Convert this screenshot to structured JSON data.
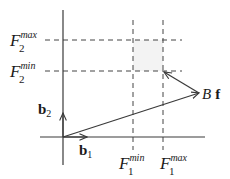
{
  "diagram": {
    "type": "vector-bounds-diagram",
    "axes": {
      "vertical": {
        "x": 63,
        "y1": 10,
        "y2": 165
      },
      "horizontal": {
        "y": 137,
        "x1": 40,
        "x2": 205
      }
    },
    "bounds_box": {
      "x_min": 133,
      "x_max": 163,
      "y_min": 40,
      "y_max": 71,
      "fill": "#f3f3f3"
    },
    "colors": {
      "line": "#3a3a3a",
      "dash": "#444444",
      "text": "#1a1a1a"
    }
  },
  "labels": {
    "f2_max": {
      "base": "F",
      "sub": "2",
      "sup": "max"
    },
    "f2_min": {
      "base": "F",
      "sub": "2",
      "sup": "min"
    },
    "f1_min": {
      "base": "F",
      "sub": "1",
      "sup": "min"
    },
    "f1_max": {
      "base": "F",
      "sub": "1",
      "sup": "max"
    },
    "b1": {
      "base": "b",
      "sub": "1"
    },
    "b2": {
      "base": "b",
      "sub": "2"
    },
    "bf": {
      "scalar": "B",
      "vector": "f"
    }
  },
  "vectors": [
    {
      "name": "b1",
      "from": [
        63,
        137
      ],
      "to": [
        87,
        137
      ]
    },
    {
      "name": "b2",
      "from": [
        63,
        137
      ],
      "to": [
        63,
        113
      ]
    },
    {
      "name": "Bf",
      "from": [
        63,
        137
      ],
      "to": [
        199,
        93
      ]
    },
    {
      "name": "projection",
      "from": [
        199,
        93
      ],
      "to": [
        163,
        71
      ]
    }
  ]
}
